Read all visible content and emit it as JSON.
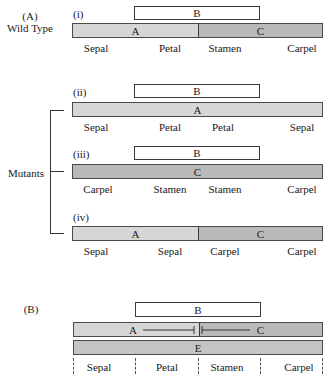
{
  "panel_a": {
    "label": "(A)",
    "sublabel": "Wild Type",
    "mutants_label": "Mutants",
    "rows": [
      {
        "id": "(i)",
        "b_label": "B",
        "segments": [
          {
            "label": "A",
            "color": "#d6d6d6"
          },
          {
            "label": "C",
            "color": "#b9b9b9"
          }
        ],
        "organs": [
          "Sepal",
          "Petal",
          "Stamen",
          "Carpel"
        ]
      },
      {
        "id": "(ii)",
        "b_label": "B",
        "segments": [
          {
            "label": "A",
            "color": "#d6d6d6"
          }
        ],
        "organs": [
          "Sepal",
          "Petal",
          "Petal",
          "Sepal"
        ]
      },
      {
        "id": "(iii)",
        "b_label": "B",
        "segments": [
          {
            "label": "C",
            "color": "#b9b9b9"
          }
        ],
        "organs": [
          "Carpel",
          "Stamen",
          "Stamen",
          "Carpel"
        ]
      },
      {
        "id": "(iv)",
        "segments": [
          {
            "label": "A",
            "color": "#d6d6d6"
          },
          {
            "label": "C",
            "color": "#b9b9b9"
          }
        ],
        "organs": [
          "Sepal",
          "Sepal",
          "Carpel",
          "Carpel"
        ]
      }
    ]
  },
  "panel_b": {
    "label": "(B)",
    "b_label": "B",
    "a_label": "A",
    "c_label": "C",
    "e_label": "E",
    "organs": [
      "Sepal",
      "Petal",
      "Stamen",
      "Carpel"
    ]
  },
  "colors": {
    "a_fill": "#d6d6d6",
    "c_fill": "#b9b9b9",
    "e_fill": "#c4c4c4",
    "b_fill": "#ffffff",
    "outline": "#3a3a3a"
  }
}
